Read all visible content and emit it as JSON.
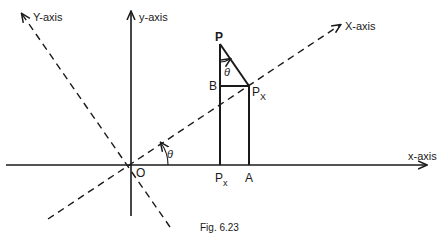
{
  "figure": {
    "caption": "Fig. 6.23",
    "axes": {
      "x_axis": "x-axis",
      "y_axis": "y-axis",
      "X_axis": "X-axis",
      "Y_axis": "Y-axis"
    },
    "points": {
      "origin": "O",
      "P": "P",
      "B": "B",
      "PX_point": "P",
      "PX_sub": "X",
      "Px_foot": "P",
      "Px_sub": "x",
      "A": "A"
    },
    "angles": {
      "rotation": "θ",
      "at_P": "θ"
    },
    "colors": {
      "ink": "#1a1a1a",
      "background": "#ffffff"
    }
  }
}
